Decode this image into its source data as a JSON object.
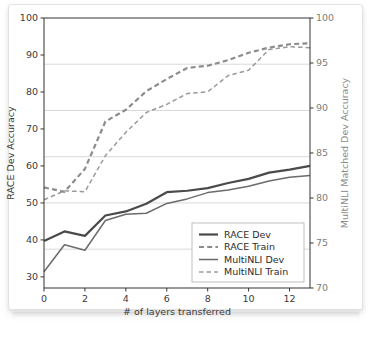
{
  "figure": {
    "kind": "line-chart-figure"
  },
  "chart_data": {
    "type": "line",
    "title": "",
    "xlabel": "# of layers transferred",
    "ylabel": "RACE Dev Accuracy",
    "ylabel_right": "MultiNLI Matched Dev Accuracy",
    "x": [
      0,
      1,
      2,
      3,
      4,
      5,
      6,
      7,
      8,
      9,
      10,
      11,
      12,
      13
    ],
    "xlim": [
      0,
      13
    ],
    "ylim": [
      27,
      100
    ],
    "ylim_right": [
      70,
      100
    ],
    "xticks": [
      0,
      2,
      4,
      6,
      8,
      10,
      12
    ],
    "xticklabels": [
      "0",
      "2",
      "4",
      "6",
      "8",
      "10",
      "12"
    ],
    "yticks": [
      30,
      40,
      50,
      60,
      70,
      80,
      90,
      100
    ],
    "yticklabels": [
      "30",
      "40",
      "50",
      "60",
      "70",
      "80",
      "90",
      "100"
    ],
    "yticks_right": [
      70,
      75,
      80,
      85,
      90,
      95,
      100
    ],
    "yticklabels_right": [
      "70",
      "75",
      "80",
      "85",
      "90",
      "95",
      "100"
    ],
    "gridlines_left": [
      37.5,
      50,
      62.5,
      75,
      87.5
    ],
    "grid": true,
    "legend_position": "lower right",
    "series": [
      {
        "name": "RACE Dev",
        "axis": "left",
        "style": "solid",
        "width": 2.2,
        "color": "#4a4a4a",
        "values": [
          39.7,
          42.3,
          41.1,
          46.6,
          47.7,
          49.8,
          52.9,
          53.3,
          54.0,
          55.4,
          56.5,
          58.2,
          59.0,
          60.0
        ]
      },
      {
        "name": "RACE Train",
        "axis": "left",
        "style": "dashed",
        "width": 2.2,
        "color": "#8c8c8c",
        "values": [
          54.2,
          53.0,
          59.2,
          72.0,
          75.2,
          80.2,
          83.5,
          86.5,
          87.1,
          88.6,
          90.6,
          92.0,
          92.9,
          93.2
        ]
      },
      {
        "name": "MultiNLI Dev",
        "axis": "right",
        "style": "solid",
        "width": 1.5,
        "color": "#6b6b6b",
        "values": [
          71.8,
          74.8,
          74.2,
          77.5,
          78.2,
          78.3,
          79.4,
          79.9,
          80.6,
          80.9,
          81.3,
          81.9,
          82.3,
          82.5
        ]
      },
      {
        "name": "MultiNLI Train",
        "axis": "right",
        "style": "dashed",
        "width": 1.5,
        "color": "#9a9a9a",
        "values": [
          79.8,
          80.8,
          80.7,
          84.7,
          87.3,
          89.5,
          90.4,
          91.6,
          91.8,
          93.6,
          94.2,
          96.5,
          96.8,
          96.7
        ]
      }
    ],
    "legend_entries": [
      {
        "label": "RACE Dev",
        "style": "solid",
        "width": 2.2,
        "color": "#4a4a4a"
      },
      {
        "label": "RACE Train",
        "style": "dashed",
        "width": 2.2,
        "color": "#8c8c8c"
      },
      {
        "label": "MultiNLI Dev",
        "style": "solid",
        "width": 1.5,
        "color": "#6b6b6b"
      },
      {
        "label": "MultiNLI Train",
        "style": "dashed",
        "width": 1.5,
        "color": "#9a9a9a"
      }
    ]
  },
  "colors": {
    "axis": "#333333",
    "grid": "#c8c8c8",
    "background": "#ffffff",
    "legend_border": "#b0b0b0"
  }
}
